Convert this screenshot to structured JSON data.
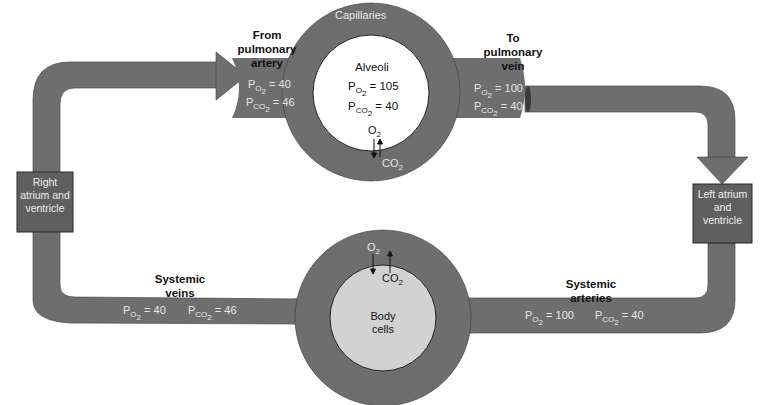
{
  "colors": {
    "vessel": "#6e6e6e",
    "vessel_edge": "#3a3a3a",
    "box": "#5f5f5f",
    "alveoli_fill": "#ffffff",
    "body_cells_fill": "#d2d2d2",
    "light_text": "#e8e8e8",
    "dark_text": "#111111"
  },
  "pulmonary": {
    "capillaries_label": "Capillaries",
    "alveoli": {
      "title": "Alveoli",
      "po2_label": "P",
      "po2_sub": "O2",
      "po2_value": "= 105",
      "pco2_label": "P",
      "pco2_sub": "CO2",
      "pco2_value": "= 40"
    },
    "exchange": {
      "o2": "O",
      "o2_sub": "2",
      "co2": "CO",
      "co2_sub": "2"
    },
    "from_artery": {
      "title": "From pulmonary artery",
      "po2_value": "= 40",
      "pco2_value": "= 46"
    },
    "to_vein": {
      "title": "To pulmonary vein",
      "po2_value": "= 100",
      "pco2_value": "= 40"
    }
  },
  "heart": {
    "right": "Right atrium and ventricle",
    "left": "Left atrium and ventricle"
  },
  "systemic": {
    "body_cells": "Body cells",
    "exchange": {
      "o2": "O",
      "o2_sub": "2",
      "co2": "CO",
      "co2_sub": "2"
    },
    "veins": {
      "title": "Systemic veins",
      "po2_value": "= 40",
      "pco2_value": "= 46"
    },
    "arteries": {
      "title": "Systemic arteries",
      "po2_value": "= 100",
      "pco2_value": "= 40"
    }
  },
  "symbols": {
    "P": "P",
    "O2": "O2",
    "CO2": "CO2"
  }
}
